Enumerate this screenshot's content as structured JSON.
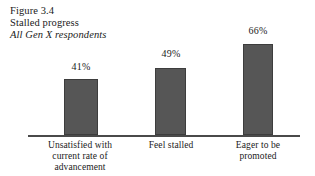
{
  "figure": {
    "number": "Figure 3.4",
    "title": "Stalled progress",
    "subtitle": "All Gen X respondents"
  },
  "colors": {
    "bar_fill": "#565656",
    "bar_edge": "#3d3d3d",
    "axis": "#4a4a4a",
    "background": "#ffffff",
    "text": "#1a1a1a"
  },
  "chart_data": {
    "type": "bar",
    "title": "Stalled progress",
    "subtitle": "All Gen X respondents",
    "categories": [
      "Unsatisfied with current rate of advancement",
      "Feel stalled",
      "Eager to be promoted"
    ],
    "category_lines": [
      [
        "Unsatisfied with",
        "current rate of",
        "advancement"
      ],
      [
        "Feel stalled"
      ],
      [
        "Eager to be",
        "promoted"
      ]
    ],
    "values": [
      41,
      49,
      66
    ],
    "value_labels": [
      "41%",
      "49%",
      "66%"
    ],
    "xlabel": "",
    "ylabel": "",
    "ylim": [
      0,
      100
    ],
    "grid": false,
    "legend": false,
    "units": "percent"
  }
}
